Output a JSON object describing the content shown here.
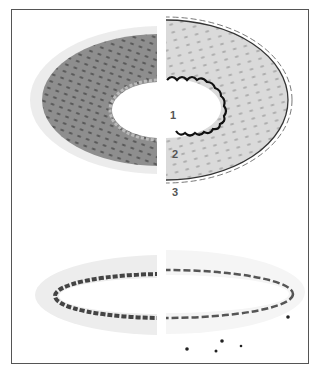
{
  "figure": {
    "labels": [
      {
        "id": "1",
        "text": "1"
      },
      {
        "id": "2",
        "text": "2"
      },
      {
        "id": "3",
        "text": "3"
      }
    ],
    "colors": {
      "frame": "#555555",
      "dark_tissue": "#8a8a8a",
      "light_tissue": "#d4d4d4",
      "elastic_lamina": "#1a1a1a",
      "nuclei": "#6a6a6a"
    }
  }
}
